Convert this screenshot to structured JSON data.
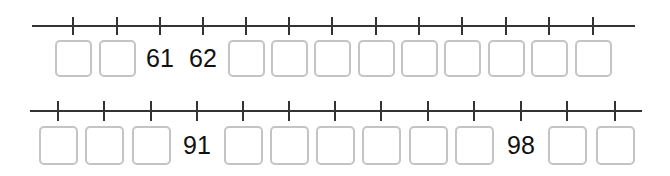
{
  "number_lines": [
    {
      "id": "top",
      "line": {
        "x1": 32,
        "x2": 635,
        "y": 26
      },
      "tick_x": [
        73,
        117,
        160,
        203,
        246,
        289,
        332,
        376,
        419,
        462,
        506,
        549,
        593
      ],
      "cells": [
        {
          "value": "",
          "blank": true
        },
        {
          "value": "",
          "blank": true
        },
        {
          "value": "61",
          "blank": false
        },
        {
          "value": "62",
          "blank": false
        },
        {
          "value": "",
          "blank": true
        },
        {
          "value": "",
          "blank": true
        },
        {
          "value": "",
          "blank": true
        },
        {
          "value": "",
          "blank": true
        },
        {
          "value": "",
          "blank": true
        },
        {
          "value": "",
          "blank": true
        },
        {
          "value": "",
          "blank": true
        },
        {
          "value": "",
          "blank": true
        },
        {
          "value": "",
          "blank": true
        }
      ]
    },
    {
      "id": "bottom",
      "line": {
        "x1": 30,
        "x2": 642,
        "y": 111
      },
      "tick_x": [
        58,
        104,
        151,
        197,
        243,
        289,
        335,
        381,
        428,
        474,
        521,
        567,
        615
      ],
      "cells": [
        {
          "value": "",
          "blank": true
        },
        {
          "value": "",
          "blank": true
        },
        {
          "value": "",
          "blank": true
        },
        {
          "value": "91",
          "blank": false
        },
        {
          "value": "",
          "blank": true
        },
        {
          "value": "",
          "blank": true
        },
        {
          "value": "",
          "blank": true
        },
        {
          "value": "",
          "blank": true
        },
        {
          "value": "",
          "blank": true
        },
        {
          "value": "",
          "blank": true
        },
        {
          "value": "98",
          "blank": false
        },
        {
          "value": "",
          "blank": true
        },
        {
          "value": "",
          "blank": true
        }
      ]
    }
  ],
  "colors": {
    "line": "#333333",
    "box_border": "#c4c4c4",
    "text": "#111111"
  }
}
